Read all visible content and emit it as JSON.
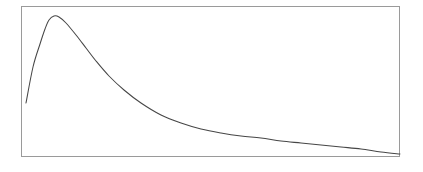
{
  "figure": {
    "width": 423,
    "height": 172,
    "background_color": "#ffffff"
  },
  "frame": {
    "left": 21,
    "top": 6,
    "width": 379,
    "height": 151,
    "border_color": "#9a9a9a",
    "border_width": 1,
    "fill_color": "#ffffff"
  },
  "chart_data": {
    "type": "line",
    "title": "",
    "subtitle": "",
    "xlabel": "",
    "ylabel": "",
    "legend": [],
    "legend_position": "none",
    "grid": false,
    "tick_labels_x": [],
    "tick_labels_y": [],
    "axis_visible_labels": false,
    "xlim": [
      0,
      1
    ],
    "ylim": [
      0,
      1
    ],
    "series": [
      {
        "name": "curve",
        "color": "#464646",
        "line_width": 1.05,
        "x": [
          0.013,
          0.032,
          0.05,
          0.063,
          0.074,
          0.087,
          0.1,
          0.119,
          0.145,
          0.171,
          0.198,
          0.232,
          0.271,
          0.316,
          0.369,
          0.422,
          0.475,
          0.528,
          0.581,
          0.634,
          0.687,
          0.74,
          0.793,
          0.846,
          0.898,
          0.951,
          1.0
        ],
        "y": [
          0.358,
          0.596,
          0.748,
          0.848,
          0.907,
          0.934,
          0.927,
          0.887,
          0.808,
          0.722,
          0.636,
          0.54,
          0.444,
          0.358,
          0.278,
          0.225,
          0.186,
          0.159,
          0.139,
          0.123,
          0.109,
          0.096,
          0.083,
          0.07,
          0.056,
          0.04,
          0.027
        ]
      }
    ],
    "pixel_polyline": [
      [
        26,
        103
      ],
      [
        33,
        67
      ],
      [
        40,
        44
      ],
      [
        45,
        29
      ],
      [
        49,
        20
      ],
      [
        54,
        16
      ],
      [
        59,
        17
      ],
      [
        66,
        23
      ],
      [
        76,
        35
      ],
      [
        86,
        48
      ],
      [
        96,
        61
      ],
      [
        109,
        76
      ],
      [
        124,
        90
      ],
      [
        141,
        103
      ],
      [
        161,
        115
      ],
      [
        181,
        123
      ],
      [
        201,
        129
      ],
      [
        221,
        133
      ],
      [
        241,
        136
      ],
      [
        261,
        138
      ],
      [
        281,
        141
      ],
      [
        301,
        143
      ],
      [
        321,
        145
      ],
      [
        341,
        147
      ],
      [
        361,
        149
      ],
      [
        381,
        152
      ],
      [
        400,
        154
      ]
    ]
  }
}
